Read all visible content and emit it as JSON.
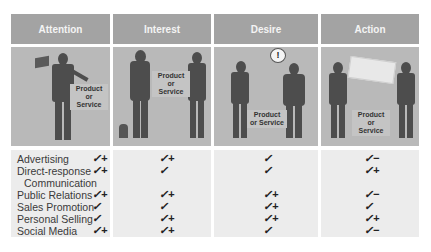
{
  "stages": [
    {
      "title": "Attention",
      "image_label": "Product or Service"
    },
    {
      "title": "Interest",
      "image_label": "Product or Service"
    },
    {
      "title": "Desire",
      "image_label": "Product or Service",
      "bubble_icon": "!"
    },
    {
      "title": "Action",
      "image_label": "Product or Service"
    }
  ],
  "tools": [
    {
      "label": "Advertising",
      "ratings": [
        "✓+",
        "✓+",
        "✓",
        "✓−"
      ]
    },
    {
      "label": "Direct-response",
      "label_cont": "Communication",
      "ratings": [
        "✓+",
        "✓",
        "✓",
        "✓+"
      ]
    },
    {
      "label": "Public Relations",
      "ratings": [
        "✓+",
        "✓+",
        "✓+",
        "✓−"
      ]
    },
    {
      "label": "Sales Promotion",
      "ratings": [
        "✓",
        "✓",
        "✓+",
        "✓"
      ]
    },
    {
      "label": "Personal Selling",
      "ratings": [
        "✓",
        "✓+",
        "✓+",
        "✓+"
      ]
    },
    {
      "label": "Social Media",
      "ratings": [
        "✓+",
        "✓+",
        "✓",
        "✓−"
      ]
    }
  ],
  "colors": {
    "header_bg": "#a3a3a3",
    "image_bg": "#b9b9b9",
    "table_bg": "#ececec",
    "silhouette": "#4d4d4d"
  }
}
